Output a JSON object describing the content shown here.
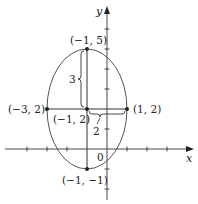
{
  "figure": {
    "type": "ellipse-graph",
    "colors": {
      "stroke": "#333333",
      "background": "#ffffff"
    },
    "axes": {
      "x_label": "x",
      "y_label": "y",
      "origin_label": "0",
      "x_ticks": [
        -4,
        -3,
        -2,
        -1,
        1,
        2,
        3
      ],
      "y_ticks": [
        -2,
        -1,
        1,
        2,
        3,
        4,
        5,
        6
      ]
    },
    "ellipse": {
      "center": [
        -1,
        2
      ],
      "semi_major_vertical": 3,
      "semi_minor_horizontal": 2
    },
    "points": [
      {
        "name": "top-vertex",
        "coords": [
          -1,
          5
        ],
        "label": "(−1, 5)"
      },
      {
        "name": "left-vertex",
        "coords": [
          -3,
          2
        ],
        "label": "(−3, 2)"
      },
      {
        "name": "center",
        "coords": [
          -1,
          2
        ],
        "label": "(−1, 2)"
      },
      {
        "name": "right-vertex",
        "coords": [
          1,
          2
        ],
        "label": "(1, 2)"
      },
      {
        "name": "bottom-vertex",
        "coords": [
          -1,
          -1
        ],
        "label": "(−1, −1)"
      }
    ],
    "braces": [
      {
        "name": "vertical-semi-axis",
        "label": "3"
      },
      {
        "name": "horizontal-semi-axis",
        "label": "2"
      }
    ]
  }
}
